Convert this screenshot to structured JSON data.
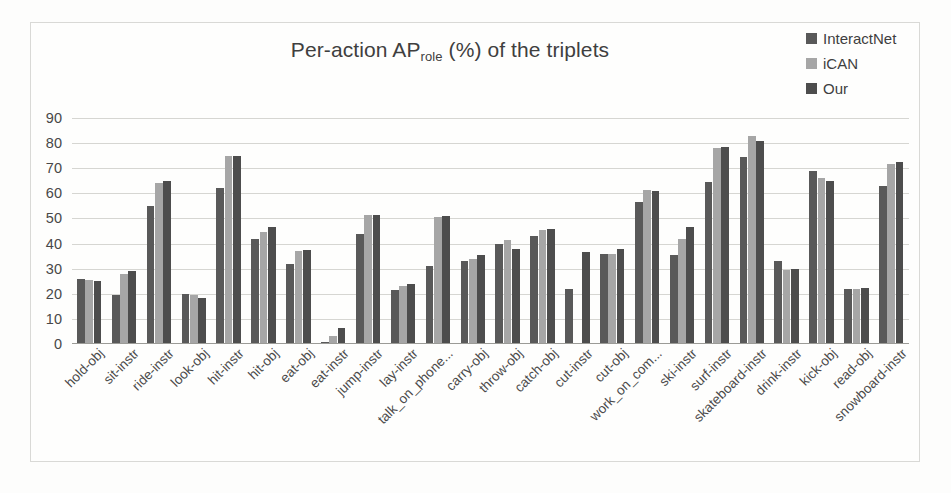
{
  "chart": {
    "title_main": "Per-action AP",
    "title_sub": "role",
    "title_tail": " (%) of the triplets"
  },
  "legend": {
    "position": "top-right",
    "entries": [
      {
        "label": "InteractNet",
        "color": "#595959"
      },
      {
        "label": "iCAN",
        "color": "#a6a6a6"
      },
      {
        "label": "Our",
        "color": "#4d4d4d"
      }
    ]
  },
  "axis": {
    "y_ticks": [
      "90",
      "80",
      "70",
      "60",
      "50",
      "40",
      "30",
      "20",
      "10",
      "0"
    ]
  },
  "chart_data": {
    "type": "bar",
    "xlabel": "",
    "ylabel": "",
    "ylim": [
      0,
      90
    ],
    "ytick_step": 10,
    "grid": true,
    "legend_position": "top-right",
    "categories": [
      "hold-obj",
      "sit-instr",
      "ride-instr",
      "look-obj",
      "hit-instr",
      "hit-obj",
      "eat-obj",
      "eat-instr",
      "jump-instr",
      "lay-instr",
      "talk_on_phone...",
      "carry-obj",
      "throw-obj",
      "catch-obj",
      "cut-instr",
      "cut-obj",
      "work_on_com...",
      "ski-instr",
      "surf-instr",
      "skateboard-instr",
      "drink-instr",
      "kick-obj",
      "read-obj",
      "snowboard-instr"
    ],
    "series": [
      {
        "name": "InteractNet",
        "color": "#595959",
        "values": [
          26,
          19.5,
          55,
          20,
          62,
          42,
          32,
          1,
          44,
          21.5,
          31,
          33,
          40,
          43,
          22,
          36,
          56.5,
          35.5,
          64.5,
          74.5,
          33,
          69,
          22,
          63
        ]
      },
      {
        "name": "iCAN",
        "color": "#a6a6a6",
        "values": [
          25.5,
          28,
          64,
          19.5,
          75,
          44.5,
          37,
          3,
          51.5,
          23,
          50.5,
          34,
          41.5,
          45.5,
          0,
          36,
          61.5,
          42,
          78,
          83,
          29.5,
          66,
          22,
          71.5
        ]
      },
      {
        "name": "Our",
        "color": "#4d4d4d",
        "values": [
          25,
          29,
          65,
          18.5,
          75,
          46.5,
          37.5,
          6.5,
          51.5,
          24,
          51,
          35.5,
          38,
          46,
          36.5,
          38,
          61,
          46.5,
          78.5,
          81,
          30,
          65,
          22.5,
          72.5
        ]
      }
    ]
  }
}
